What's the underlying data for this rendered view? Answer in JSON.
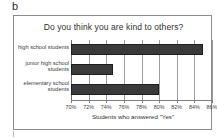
{
  "panel": {
    "label": "b"
  },
  "chart_data": {
    "type": "bar",
    "orientation": "horizontal",
    "title": "Do you think you are kind to others?",
    "xlabel": "Students who answered \"Yes\"",
    "ylabel": "",
    "categories": [
      "high school students",
      "junior high school students",
      "elementary school students"
    ],
    "category_lines": [
      [
        "high school students"
      ],
      [
        "junior high school",
        "students"
      ],
      [
        "elementary school",
        "students"
      ]
    ],
    "values": [
      85.0,
      74.8,
      80.0
    ],
    "value_unit": "%",
    "xlim": [
      70,
      86
    ],
    "xticks": [
      70,
      72,
      74,
      76,
      78,
      80,
      82,
      84,
      86
    ],
    "xtick_labels": [
      "70%",
      "72%",
      "74%",
      "76%",
      "78%",
      "80%",
      "82%",
      "84%",
      "86%"
    ],
    "grid": true,
    "grid_axis": "x",
    "legend": null,
    "bar_color": "#3a3a3a",
    "frame_color": "#8c8c8c",
    "background": "#ffffff"
  }
}
